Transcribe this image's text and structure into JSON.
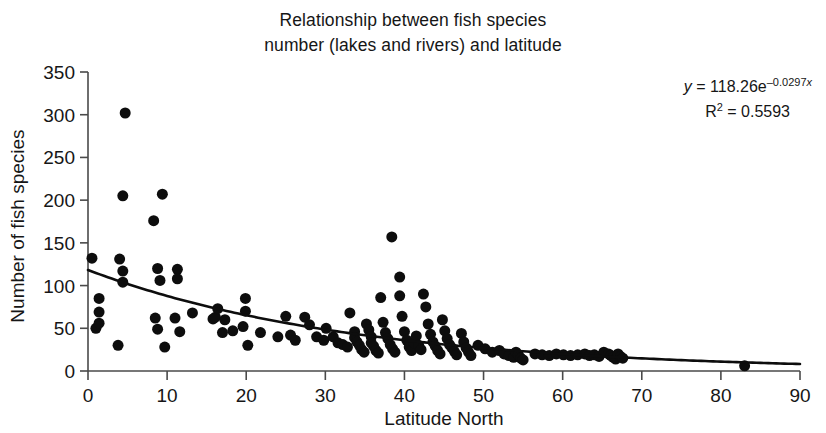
{
  "figure": {
    "title_line1": "Relationship between fish species",
    "title_line2": "number (lakes and rivers) and latitude",
    "title_full": "Relationship between fish species\nnumber (lakes and rivers) and latitude",
    "background_color": "#ffffff",
    "point_color": "#0d0d0d",
    "curve_color": "#0d0d0d",
    "axis_color": "#4a4a4a"
  },
  "annotation": {
    "equation_prefix": "y",
    "equation_body": " = 118.26e",
    "equation_exponent": "–0.0297",
    "equation_exponent_var": "x",
    "r2_prefix": "R",
    "r2_sup": "2",
    "r2_body": " = 0.5593",
    "equation_plain": "y = 118.26e^(-0.0297x)",
    "r2_plain": "R² = 0.5593",
    "r_squared_value": 0.5593,
    "coefficient": 118.26,
    "exponent_rate": -0.0297
  },
  "chart_data": {
    "type": "scatter",
    "title": "Relationship between fish species number (lakes and rivers) and latitude",
    "xlabel": "Latitude North",
    "ylabel": "Number of fish species",
    "xlim": [
      0,
      90
    ],
    "ylim": [
      0,
      350
    ],
    "xticks": [
      0,
      10,
      20,
      30,
      40,
      50,
      60,
      70,
      80,
      90
    ],
    "yticks": [
      0,
      50,
      100,
      150,
      200,
      250,
      300,
      350
    ],
    "xtick_labels": [
      "0",
      "10",
      "20",
      "30",
      "40",
      "50",
      "60",
      "70",
      "80",
      "90"
    ],
    "ytick_labels": [
      "0",
      "50",
      "100",
      "150",
      "200",
      "250",
      "300",
      "350"
    ],
    "grid": false,
    "legend": false,
    "marker": "circle",
    "marker_size": 11,
    "fit": {
      "type": "exponential",
      "equation": "y = 118.26e^(-0.0297x)",
      "a": 118.26,
      "b": -0.0297,
      "r_squared": 0.5593,
      "x_range": [
        0,
        90
      ]
    },
    "points": [
      [
        0.5,
        132
      ],
      [
        1.0,
        50
      ],
      [
        1.4,
        85
      ],
      [
        1.4,
        69
      ],
      [
        1.4,
        56
      ],
      [
        4.7,
        302
      ],
      [
        4.4,
        205
      ],
      [
        4.0,
        131
      ],
      [
        4.4,
        117
      ],
      [
        4.4,
        104
      ],
      [
        3.8,
        30
      ],
      [
        8.3,
        176
      ],
      [
        9.4,
        207
      ],
      [
        8.8,
        120
      ],
      [
        9.1,
        106
      ],
      [
        8.5,
        62
      ],
      [
        8.8,
        49
      ],
      [
        9.7,
        28
      ],
      [
        11.3,
        119
      ],
      [
        11.3,
        108
      ],
      [
        11.0,
        62
      ],
      [
        11.6,
        46
      ],
      [
        13.2,
        68
      ],
      [
        15.8,
        61
      ],
      [
        16.1,
        63
      ],
      [
        16.4,
        73
      ],
      [
        17.3,
        60
      ],
      [
        17.0,
        45
      ],
      [
        18.3,
        47
      ],
      [
        19.9,
        85
      ],
      [
        19.9,
        70
      ],
      [
        19.6,
        52
      ],
      [
        20.2,
        30
      ],
      [
        21.8,
        45
      ],
      [
        24.0,
        40
      ],
      [
        25.0,
        64
      ],
      [
        25.6,
        42
      ],
      [
        26.2,
        36
      ],
      [
        27.4,
        63
      ],
      [
        28.0,
        54
      ],
      [
        28.9,
        40
      ],
      [
        29.8,
        36
      ],
      [
        30.1,
        50
      ],
      [
        31.0,
        40
      ],
      [
        31.6,
        33
      ],
      [
        32.2,
        31
      ],
      [
        32.8,
        28
      ],
      [
        33.1,
        68
      ],
      [
        33.7,
        46
      ],
      [
        33.7,
        39
      ],
      [
        34.0,
        34
      ],
      [
        34.3,
        30
      ],
      [
        34.6,
        25
      ],
      [
        34.9,
        22
      ],
      [
        35.2,
        55
      ],
      [
        35.5,
        48
      ],
      [
        35.8,
        40
      ],
      [
        35.8,
        33
      ],
      [
        36.1,
        29
      ],
      [
        36.4,
        24
      ],
      [
        36.7,
        21
      ],
      [
        37.0,
        86
      ],
      [
        37.3,
        57
      ],
      [
        37.6,
        45
      ],
      [
        37.9,
        38
      ],
      [
        38.2,
        31
      ],
      [
        38.4,
        157
      ],
      [
        38.5,
        26
      ],
      [
        38.8,
        22
      ],
      [
        39.4,
        110
      ],
      [
        39.4,
        88
      ],
      [
        39.7,
        64
      ],
      [
        40.0,
        46
      ],
      [
        40.3,
        36
      ],
      [
        40.6,
        28
      ],
      [
        40.9,
        24
      ],
      [
        41.2,
        33
      ],
      [
        41.5,
        41
      ],
      [
        41.8,
        30
      ],
      [
        42.1,
        25
      ],
      [
        42.4,
        90
      ],
      [
        42.7,
        75
      ],
      [
        43.0,
        55
      ],
      [
        43.3,
        43
      ],
      [
        43.6,
        34
      ],
      [
        43.9,
        29
      ],
      [
        44.2,
        24
      ],
      [
        44.5,
        20
      ],
      [
        44.8,
        60
      ],
      [
        45.1,
        47
      ],
      [
        45.4,
        38
      ],
      [
        45.7,
        31
      ],
      [
        46.0,
        27
      ],
      [
        46.3,
        23
      ],
      [
        46.6,
        19
      ],
      [
        47.2,
        44
      ],
      [
        47.5,
        34
      ],
      [
        47.8,
        27
      ],
      [
        48.1,
        22
      ],
      [
        48.4,
        18
      ],
      [
        49.3,
        30
      ],
      [
        50.2,
        26
      ],
      [
        51.1,
        22
      ],
      [
        52.0,
        24
      ],
      [
        52.6,
        20
      ],
      [
        53.2,
        18
      ],
      [
        53.8,
        16
      ],
      [
        54.1,
        22
      ],
      [
        54.4,
        19
      ],
      [
        54.7,
        15
      ],
      [
        55.0,
        13
      ],
      [
        56.5,
        20
      ],
      [
        57.4,
        19
      ],
      [
        58.3,
        18
      ],
      [
        59.2,
        20
      ],
      [
        60.1,
        19
      ],
      [
        61.0,
        18
      ],
      [
        61.9,
        19
      ],
      [
        62.8,
        20
      ],
      [
        63.4,
        18
      ],
      [
        64.0,
        19
      ],
      [
        64.6,
        17
      ],
      [
        65.2,
        22
      ],
      [
        65.8,
        20
      ],
      [
        66.1,
        18
      ],
      [
        66.4,
        16
      ],
      [
        66.7,
        14
      ],
      [
        67.0,
        20
      ],
      [
        67.3,
        17
      ],
      [
        67.6,
        15
      ],
      [
        83.0,
        6
      ]
    ],
    "n_points": 130
  }
}
